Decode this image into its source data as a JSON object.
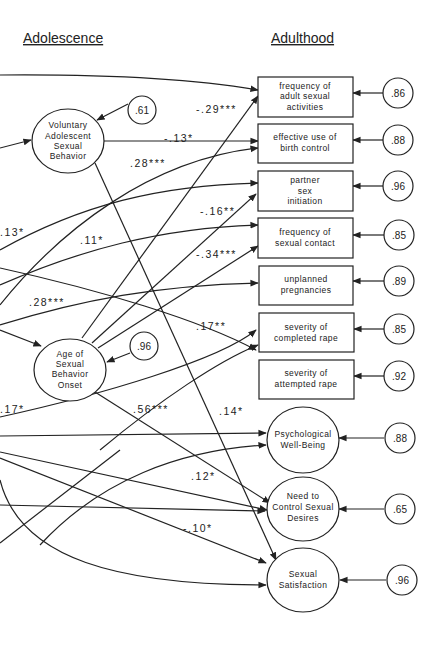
{
  "headings": {
    "left": "Adolescence",
    "right": "Adulthood"
  },
  "latent_nodes": {
    "vasb": {
      "lines": [
        "Voluntary",
        "Adolescent",
        "Sexual",
        "Behavior"
      ],
      "error": ".61"
    },
    "age_onset": {
      "lines": [
        "Age of",
        "Sexual",
        "Behavior",
        "Onset"
      ],
      "error": ".96"
    }
  },
  "outcomes": [
    {
      "id": "freq_adult",
      "shape": "box",
      "lines": [
        "frequency of",
        "adult sexual",
        "activities"
      ],
      "error": ".86"
    },
    {
      "id": "birth_control",
      "shape": "box",
      "lines": [
        "effective use of",
        "birth control"
      ],
      "error": ".88"
    },
    {
      "id": "partner_init",
      "shape": "box",
      "lines": [
        "partner",
        "sex",
        "initiation"
      ],
      "error": ".96"
    },
    {
      "id": "freq_contact",
      "shape": "box",
      "lines": [
        "frequency of",
        "sexual contact"
      ],
      "error": ".85"
    },
    {
      "id": "unplanned",
      "shape": "box",
      "lines": [
        "unplanned",
        "pregnancies"
      ],
      "error": ".89"
    },
    {
      "id": "completed_rape",
      "shape": "box",
      "lines": [
        "severity of",
        "completed rape"
      ],
      "error": ".85"
    },
    {
      "id": "attempted_rape",
      "shape": "box",
      "lines": [
        "severity of",
        "attempted rape"
      ],
      "error": ".92"
    },
    {
      "id": "psych_wellbeing",
      "shape": "ellipse",
      "lines": [
        "Psychological",
        "Well-Being"
      ],
      "error": ".88"
    },
    {
      "id": "control_desires",
      "shape": "ellipse",
      "lines": [
        "Need to",
        "Control Sexual",
        "Desires"
      ],
      "error": ".65"
    },
    {
      "id": "satisfaction",
      "shape": "ellipse",
      "lines": [
        "Sexual",
        "Satisfaction"
      ],
      "error": ".96"
    }
  ],
  "path_coefficients": [
    {
      "label": "-.29***",
      "from": "age_onset",
      "to": "freq_adult"
    },
    {
      "label": "-.13*",
      "from": "vasb",
      "to": "birth_control"
    },
    {
      "label": ".28***",
      "from": "external",
      "to": "birth_control"
    },
    {
      "label": "-.16**",
      "from": "age_onset",
      "to": "partner_init"
    },
    {
      "label": "-.34***",
      "from": "age_onset",
      "to": "freq_contact"
    },
    {
      "label": ".13*",
      "from": "external",
      "to": "partner_init"
    },
    {
      "label": ".11*",
      "from": "external",
      "to": "freq_contact"
    },
    {
      "label": ".28***",
      "from": "external",
      "to": "unplanned"
    },
    {
      "label": ".17**",
      "from": "external",
      "to": "attempted_rape"
    },
    {
      "label": ".17*",
      "from": "external",
      "to": "completed_rape"
    },
    {
      "label": ".56***",
      "from": "age_onset",
      "to": "control_desires"
    },
    {
      "label": ".14*",
      "from": "vasb",
      "to": "satisfaction"
    },
    {
      "label": ".12*",
      "from": "external",
      "to": "control_desires"
    },
    {
      "label": "-.10*",
      "from": "external",
      "to": "satisfaction"
    }
  ]
}
